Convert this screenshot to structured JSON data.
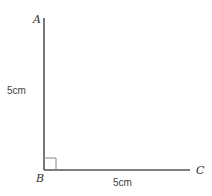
{
  "diagram": {
    "type": "right-angle",
    "vertices": {
      "A": {
        "label": "A"
      },
      "B": {
        "label": "B"
      },
      "C": {
        "label": "C"
      }
    },
    "measurements": {
      "AB": "5cm",
      "BC": "5cm"
    },
    "colors": {
      "line": "#555555",
      "right_angle_marker": "#888888"
    }
  }
}
